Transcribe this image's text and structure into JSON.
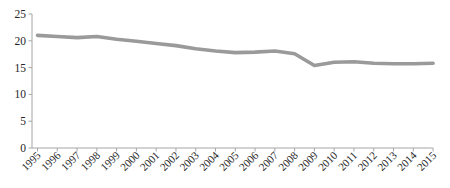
{
  "chart_data": {
    "type": "line",
    "title": "",
    "xlabel": "",
    "ylabel": "",
    "x": [
      1995,
      1996,
      1997,
      1998,
      1999,
      2000,
      2001,
      2002,
      2003,
      2004,
      2005,
      2006,
      2007,
      2008,
      2009,
      2010,
      2011,
      2012,
      2013,
      2014,
      2015
    ],
    "series": [
      {
        "name": "series-1",
        "values": [
          21.0,
          20.8,
          20.6,
          20.8,
          20.3,
          19.9,
          19.5,
          19.1,
          18.5,
          18.1,
          17.8,
          17.9,
          18.1,
          17.6,
          15.4,
          16.0,
          16.1,
          15.8,
          15.7,
          15.7,
          15.8
        ]
      }
    ],
    "ylim": [
      0,
      25
    ],
    "yticks": [
      0,
      5,
      10,
      15,
      20,
      25
    ],
    "grid": false,
    "legend": false,
    "x_tick_rotation_deg": -45
  },
  "styles": {
    "line_color": "#9a9a9a",
    "axis_color": "#a6a6a6",
    "tick_color": "#a6a6a6",
    "label_color": "#262626",
    "background_color": "#ffffff"
  }
}
